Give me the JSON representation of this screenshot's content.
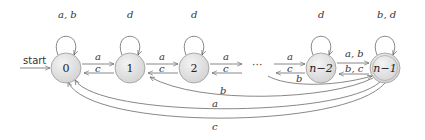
{
  "diagram": {
    "type": "finite-automaton",
    "start_label": "start",
    "ellipsis": "···",
    "states": [
      {
        "id": "s0",
        "label": "0",
        "start": true,
        "accepting": false
      },
      {
        "id": "s1",
        "label": "1",
        "start": false,
        "accepting": false
      },
      {
        "id": "s2",
        "label": "2",
        "start": false,
        "accepting": false
      },
      {
        "id": "sn2",
        "label": "n−2",
        "start": false,
        "accepting": false
      },
      {
        "id": "sn1",
        "label": "n−1",
        "start": false,
        "accepting": true
      }
    ],
    "transitions": [
      {
        "from": "0",
        "to": "0",
        "label": "a, b"
      },
      {
        "from": "1",
        "to": "1",
        "label": "d"
      },
      {
        "from": "2",
        "to": "2",
        "label": "d"
      },
      {
        "from": "n−2",
        "to": "n−2",
        "label": "d"
      },
      {
        "from": "n−1",
        "to": "n−1",
        "label": "b, d"
      },
      {
        "from": "0",
        "to": "1",
        "label": "a"
      },
      {
        "from": "1",
        "to": "0",
        "label": "c"
      },
      {
        "from": "1",
        "to": "2",
        "label": "a"
      },
      {
        "from": "2",
        "to": "1",
        "label": "c"
      },
      {
        "from": "2",
        "to": "…",
        "label": "a"
      },
      {
        "from": "…",
        "to": "2",
        "label": "c"
      },
      {
        "from": "…",
        "to": "n−2",
        "label": "a"
      },
      {
        "from": "n−2",
        "to": "…",
        "label": "c"
      },
      {
        "from": "n−2",
        "to": "n−1",
        "label": "a, b"
      },
      {
        "from": "n−1",
        "to": "n−2",
        "label": "b, c"
      },
      {
        "from": "…",
        "to": "n−1",
        "label": "b"
      },
      {
        "from": "1",
        "to": "n−1",
        "label": "b"
      },
      {
        "from": "n−1",
        "to": "0",
        "label": "a"
      },
      {
        "from": "n−1",
        "to": "0",
        "label": "c"
      }
    ]
  }
}
